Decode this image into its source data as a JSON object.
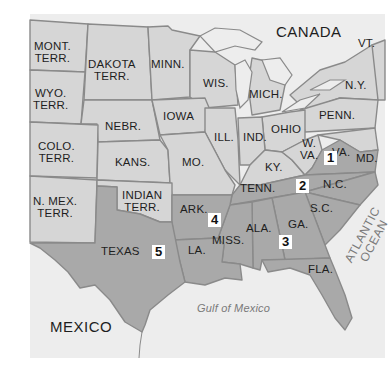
{
  "map": {
    "colors": {
      "background": "#ffffff",
      "water": "#ededed",
      "union_fill": "#d6d6d6",
      "confederate_fill": "#a9a9a9",
      "border": "#8a8a8a"
    },
    "regions": {
      "canada": "CANADA",
      "mexico": "MEXICO",
      "gulf": "Gulf of Mexico",
      "ocean_line1": "ATLANTIC",
      "ocean_line2": "OCEAN"
    },
    "states": {
      "mont_1": "MONT.",
      "mont_2": "TERR.",
      "dakota_1": "DAKOTA",
      "dakota_2": "TERR.",
      "minn": "MINN.",
      "wyo_1": "WYO.",
      "wyo_2": "TERR.",
      "wis": "WIS.",
      "mich": "MICH.",
      "ny": "N.Y.",
      "vt": "VT.",
      "iowa": "IOWA",
      "nebr": "NEBR.",
      "penn": "PENN.",
      "ohio": "OHIO",
      "ill": "ILL.",
      "ind": "IND.",
      "colo_1": "COLO.",
      "colo_2": "TERR.",
      "kans": "KANS.",
      "mo": "MO.",
      "wva_1": "W.",
      "wva_2": "VA.",
      "va": "VA.",
      "md": "MD.",
      "ky": "KY.",
      "nmex_1": "N. MEX.",
      "nmex_2": "TERR.",
      "indian_1": "INDIAN",
      "indian_2": "TERR.",
      "tenn": "TENN.",
      "nc": "N.C.",
      "sc": "S.C.",
      "ark": "ARK.",
      "miss": "MISS.",
      "ala": "ALA.",
      "ga": "GA.",
      "texas": "TEXAS",
      "la": "LA.",
      "fla": "FLA."
    },
    "markers": [
      "1",
      "2",
      "3",
      "4",
      "5"
    ]
  }
}
